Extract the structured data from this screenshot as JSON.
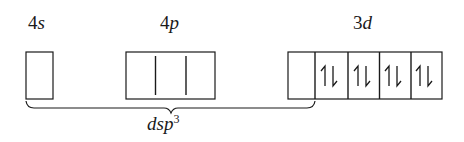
{
  "diagram": {
    "type": "orbital-box-diagram",
    "colors": {
      "ink": "#1a1a1a",
      "background": "#ffffff"
    },
    "subshells": [
      {
        "id": "4s",
        "label_num": "4",
        "label_letter": "s",
        "orbitals": 1,
        "electrons": [
          "",
          ""
        ]
      },
      {
        "id": "4p",
        "label_num": "4",
        "label_letter": "p",
        "orbitals": 3,
        "electrons": [
          "",
          "",
          ""
        ]
      },
      {
        "id": "3d",
        "label_num": "3",
        "label_letter": "d",
        "orbitals": 5,
        "electrons": [
          "",
          "↿⇂",
          "↿⇂",
          "↿⇂",
          "↿⇂"
        ]
      }
    ],
    "hybridization": {
      "label_main": "dsp",
      "label_sup": "3",
      "spans": "4s + 4p(3) + 3d(1)"
    }
  }
}
